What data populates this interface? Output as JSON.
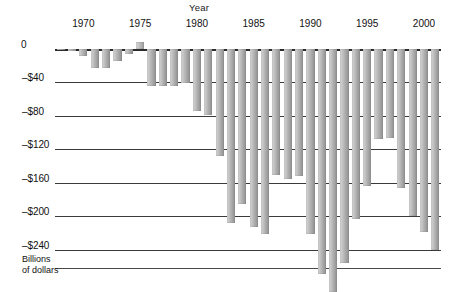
{
  "chart": {
    "title": "Year",
    "axis_caption_line1": "Billions",
    "axis_caption_line2": "of dollars"
  },
  "chart_data": {
    "type": "bar",
    "title": "Year",
    "xlabel": "Year",
    "ylabel": "Billions of dollars",
    "ylim": [
      -240,
      20
    ],
    "grid": true,
    "legend": "none",
    "ytick_labels": [
      "0",
      "–$40",
      "–$80",
      "–$120",
      "–$160",
      "–$200",
      "–$240"
    ],
    "ytick_values": [
      0,
      -40,
      -80,
      -120,
      -160,
      -200,
      -240
    ],
    "xtick_labels": [
      "1970",
      "1975",
      "1980",
      "1985",
      "1990",
      "1995",
      "2000"
    ],
    "xtick_values": [
      1970,
      1975,
      1980,
      1985,
      1990,
      1995,
      2000
    ],
    "categories": [
      1968,
      1969,
      1970,
      1971,
      1972,
      1973,
      1974,
      1975,
      1976,
      1977,
      1978,
      1979,
      1980,
      1981,
      1982,
      1983,
      1984,
      1985,
      1986,
      1987,
      1988,
      1989,
      1990,
      1991,
      1992,
      1993,
      1994,
      1995,
      1996,
      1997,
      1998,
      1999,
      2000,
      2001
    ],
    "values": [
      -2,
      -3,
      -9,
      -23,
      -23,
      -15,
      -6,
      8,
      -45,
      -45,
      -45,
      -41,
      -74,
      -79,
      -128,
      -208,
      -185,
      -212,
      -221,
      -150,
      -155,
      -152,
      -221,
      -269,
      -290,
      -255,
      -203,
      -164,
      -108,
      -107,
      -166,
      -200,
      -218,
      -240
    ]
  }
}
